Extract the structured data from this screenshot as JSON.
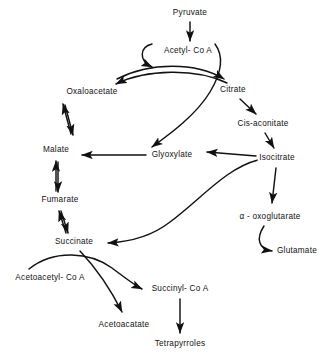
{
  "diagram": {
    "background_color": "#ffffff",
    "stroke_color": "#111111",
    "nodes": [
      {
        "id": "pyruvate",
        "label": "Pyruvate",
        "x": 190,
        "y": 13
      },
      {
        "id": "acetyl_coa",
        "label": "Acetyl- Co A",
        "x": 188,
        "y": 51
      },
      {
        "id": "oxaloacetate",
        "label": "Oxaloacetate",
        "x": 92,
        "y": 92
      },
      {
        "id": "citrate",
        "label": "Citrate",
        "x": 233,
        "y": 90
      },
      {
        "id": "cis_aconitate",
        "label": "Cis-aconitate",
        "x": 263,
        "y": 124
      },
      {
        "id": "malate",
        "label": "Malate",
        "x": 56,
        "y": 150
      },
      {
        "id": "glyoxylate",
        "label": "Glyoxylate",
        "x": 172,
        "y": 155
      },
      {
        "id": "isocitrate",
        "label": "Isocitrate",
        "x": 277,
        "y": 158
      },
      {
        "id": "fumarate",
        "label": "Fumarate",
        "x": 60,
        "y": 200
      },
      {
        "id": "oxoglutarate",
        "label": "α - oxoglutarate",
        "x": 270,
        "y": 217
      },
      {
        "id": "succinate",
        "label": "Succinate",
        "x": 74,
        "y": 242
      },
      {
        "id": "glutamate",
        "label": "Glutamate",
        "x": 297,
        "y": 251
      },
      {
        "id": "acetoacetyl_coa",
        "label": "Acetoacetyl- Co A",
        "x": 50,
        "y": 278
      },
      {
        "id": "succinyl_coa",
        "label": "Succinyl- Co A",
        "x": 180,
        "y": 289
      },
      {
        "id": "acetoacatate",
        "label": "Acetoacatate",
        "x": 124,
        "y": 325
      },
      {
        "id": "tetrapyrroles",
        "label": "Tetrapyrroles",
        "x": 180,
        "y": 344
      }
    ],
    "edges": [
      {
        "id": "pyruvate-to-acetyl-coa",
        "from": "pyruvate",
        "to": "acetyl_coa",
        "style": "straight",
        "arrow": "single"
      },
      {
        "id": "oxaloacetate-to-citrate",
        "from": "oxaloacetate",
        "to": "citrate",
        "style": "curve",
        "arrow": "single"
      },
      {
        "id": "citrate-to-oxaloacetate",
        "from": "citrate",
        "to": "oxaloacetate",
        "style": "curve",
        "arrow": "single"
      },
      {
        "id": "acetyl-coa-hook-left",
        "from": "acetyl_coa",
        "to": "oxaloacetate",
        "style": "hook",
        "arrow": "single"
      },
      {
        "id": "acetyl-coa-to-glyoxylate",
        "from": "acetyl_coa",
        "to": "glyoxylate",
        "style": "curve",
        "arrow": "single"
      },
      {
        "id": "citrate-to-cis-aconitate",
        "from": "citrate",
        "to": "cis_aconitate",
        "style": "straight",
        "arrow": "single"
      },
      {
        "id": "cis-aconitate-to-isocitrate",
        "from": "cis_aconitate",
        "to": "isocitrate",
        "style": "straight",
        "arrow": "single"
      },
      {
        "id": "isocitrate-to-glyoxylate",
        "from": "isocitrate",
        "to": "glyoxylate",
        "style": "straight",
        "arrow": "single"
      },
      {
        "id": "glyoxylate-to-malate",
        "from": "glyoxylate",
        "to": "malate",
        "style": "straight",
        "arrow": "single"
      },
      {
        "id": "isocitrate-to-succinate",
        "from": "isocitrate",
        "to": "succinate",
        "style": "s-curve",
        "arrow": "single"
      },
      {
        "id": "isocitrate-to-oxoglutarate",
        "from": "isocitrate",
        "to": "oxoglutarate",
        "style": "straight",
        "arrow": "single"
      },
      {
        "id": "oxoglutarate-to-glutamate",
        "from": "oxoglutarate",
        "to": "glutamate",
        "style": "hook",
        "arrow": "single"
      },
      {
        "id": "malate-fumarate",
        "from": "malate",
        "to": "fumarate",
        "style": "straight",
        "arrow": "double"
      },
      {
        "id": "fumarate-succinate",
        "from": "fumarate",
        "to": "succinate",
        "style": "straight",
        "arrow": "double"
      },
      {
        "id": "oxaloacetate-malate",
        "from": "oxaloacetate",
        "to": "malate",
        "style": "straight",
        "arrow": "double"
      },
      {
        "id": "succinate-to-acetoacatate",
        "from": "succinate",
        "to": "acetoacatate",
        "style": "curve",
        "arrow": "single"
      },
      {
        "id": "acetoacetyl-coa-to-succinyl-coa",
        "from": "acetoacetyl_coa",
        "to": "succinyl_coa",
        "style": "curve",
        "arrow": "single"
      },
      {
        "id": "succinyl-coa-to-tetrapyrroles",
        "from": "succinyl_coa",
        "to": "tetrapyrroles",
        "style": "straight",
        "arrow": "single"
      }
    ]
  }
}
